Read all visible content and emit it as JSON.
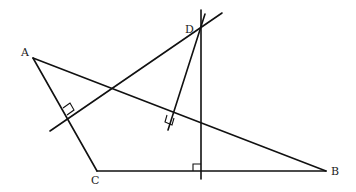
{
  "figure": {
    "type": "geometry-diagram",
    "points": [
      {
        "name": "A",
        "x": 33,
        "y": 58,
        "label_x": 21,
        "label_y": 56
      },
      {
        "name": "B",
        "x": 326,
        "y": 171,
        "label_x": 331,
        "label_y": 175
      },
      {
        "name": "C",
        "x": 97,
        "y": 171,
        "label_x": 91,
        "label_y": 184
      },
      {
        "name": "D",
        "x": 200,
        "y": 29,
        "label_x": 185,
        "label_y": 33
      }
    ],
    "labels": {
      "A": "A",
      "B": "B",
      "C": "C",
      "D": "D"
    },
    "segments": [
      {
        "from": "A",
        "to": "B"
      },
      {
        "from": "A",
        "to": "C"
      },
      {
        "from": "C",
        "to": "B"
      }
    ],
    "lines": [
      {
        "name": "perpendicular-to-AC-through-D",
        "x1": 50,
        "y1": 131,
        "x2": 222,
        "y2": 13
      },
      {
        "name": "perpendicular-to-AB-through-D",
        "x1": 205,
        "y1": 14,
        "x2": 168,
        "y2": 130
      },
      {
        "name": "perpendicular-to-CB-through-D",
        "x1": 201,
        "y1": 10,
        "x2": 201,
        "y2": 179
      }
    ],
    "right_angle_marks": 3,
    "colors": {
      "stroke": "#111111",
      "background": "#ffffff"
    }
  }
}
